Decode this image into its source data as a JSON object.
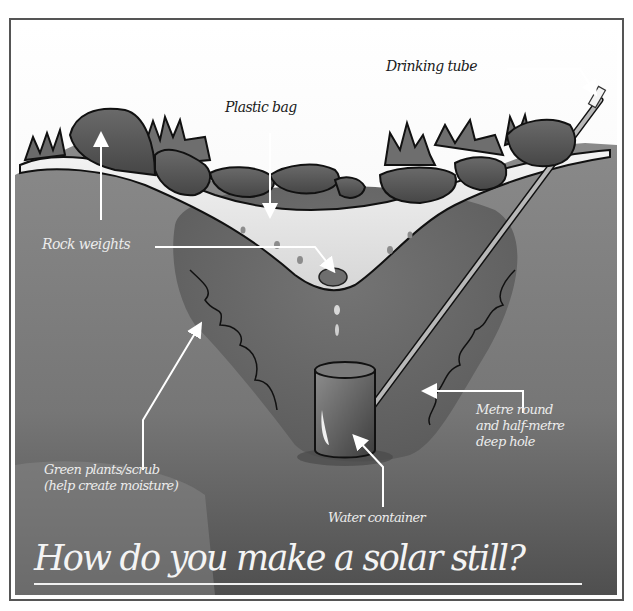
{
  "diagram": {
    "title": "How do you make a solar still?",
    "labels": {
      "drinking_tube": "Drinking tube",
      "plastic_bag": "Plastic bag",
      "rock_weights": "Rock weights",
      "metre_round_line1": "Metre round",
      "metre_round_line2": "and half-metre",
      "metre_round_line3": "deep hole",
      "green_plants_line1": "Green plants/scrub",
      "green_plants_line2": "(help create moisture)",
      "water_container": "Water container"
    },
    "colors": {
      "sky": "#f7f7f7",
      "ground": "#7d7d7d",
      "ground_dark": "#5e5e5e",
      "hole": "#6a6a6a",
      "rock": "#5a5a5a",
      "rock_outline": "#111111",
      "plastic": "#e9e9e9",
      "arrow": "#ffffff",
      "frame": "#2e2e2e"
    }
  }
}
